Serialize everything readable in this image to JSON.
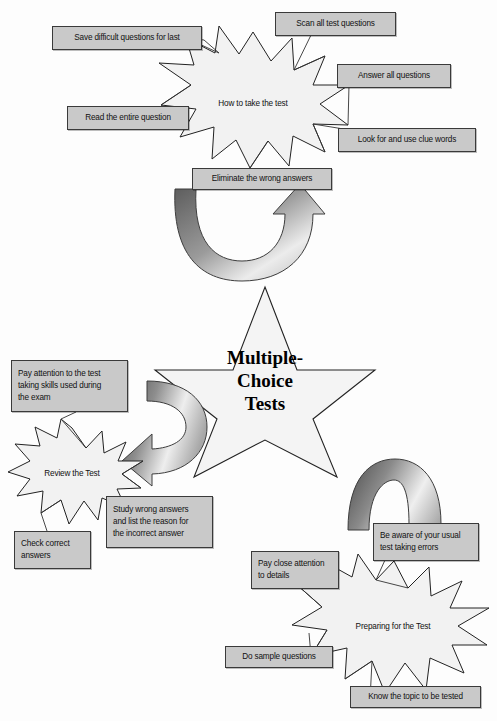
{
  "colors": {
    "box_fill": "#c9c9c9",
    "box_border": "#3a3a3a",
    "burst_fill": "#f2f2f2",
    "star_fill": "#f4f4f4",
    "outline": "#222222",
    "arrow_dark": "#4a4a4a",
    "arrow_light": "#e8e8e8",
    "page_bg": "#fdfdfd"
  },
  "center": {
    "shape": "five-point-star",
    "line1": "Multiple-",
    "line2": "Choice",
    "line3": "Tests"
  },
  "clusters": {
    "how_to_take": {
      "burst_label": "How to take the test",
      "boxes": [
        {
          "id": "save-difficult",
          "text": "Save difficult questions for last"
        },
        {
          "id": "scan-all",
          "text": "Scan all test questions"
        },
        {
          "id": "answer-all",
          "text": "Answer all questions"
        },
        {
          "id": "read-entire",
          "text": "Read the entire question"
        },
        {
          "id": "clue-words",
          "text": "Look for and use clue words"
        },
        {
          "id": "eliminate-wrong",
          "text": "Eliminate the wrong answers"
        }
      ]
    },
    "review": {
      "burst_label": "Review the Test",
      "boxes": [
        {
          "id": "pay-attention-skills",
          "line1": "Pay attention to the test",
          "line2": "taking skills used during",
          "line3": "the exam"
        },
        {
          "id": "check-correct",
          "line1": "Check correct",
          "line2": "answers"
        },
        {
          "id": "study-wrong",
          "line1": "Study wrong answers",
          "line2": "and list the reason for",
          "line3": "the incorrect answer"
        }
      ]
    },
    "preparing": {
      "burst_label": "Preparing for the Test",
      "boxes": [
        {
          "id": "be-aware-errors",
          "line1": "Be aware of your usual",
          "line2": "test taking errors"
        },
        {
          "id": "pay-close-attention",
          "line1": "Pay close attention",
          "line2": "to details"
        },
        {
          "id": "do-sample",
          "text": "Do sample questions"
        },
        {
          "id": "know-topic",
          "text": "Know the topic to be tested"
        }
      ]
    }
  },
  "arrows": [
    {
      "id": "arrow-eliminate-up",
      "shape": "u-turn-arrow",
      "direction": "up-right"
    },
    {
      "id": "arrow-center-to-review",
      "shape": "c-curve-arrow",
      "direction": "down-left"
    },
    {
      "id": "arrow-center-to-preparing",
      "shape": "arch-arrow",
      "direction": "down-right"
    }
  ]
}
